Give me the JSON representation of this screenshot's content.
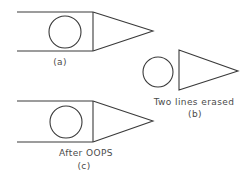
{
  "figure": {
    "stroke_color": "#3a3a3a",
    "text_color": "#4a4a4a",
    "panels": [
      {
        "id": "a",
        "caption": "(a)",
        "description": "Rectangle with circle inside and triangle attached on right"
      },
      {
        "id": "b",
        "title": "Two lines erased",
        "caption": "(b)",
        "description": "Circle and triangle remain after erasing rectangle's top and bottom lines"
      },
      {
        "id": "c",
        "title": "After OOPS",
        "caption": "(c)",
        "description": "Erased lines restored"
      }
    ]
  }
}
